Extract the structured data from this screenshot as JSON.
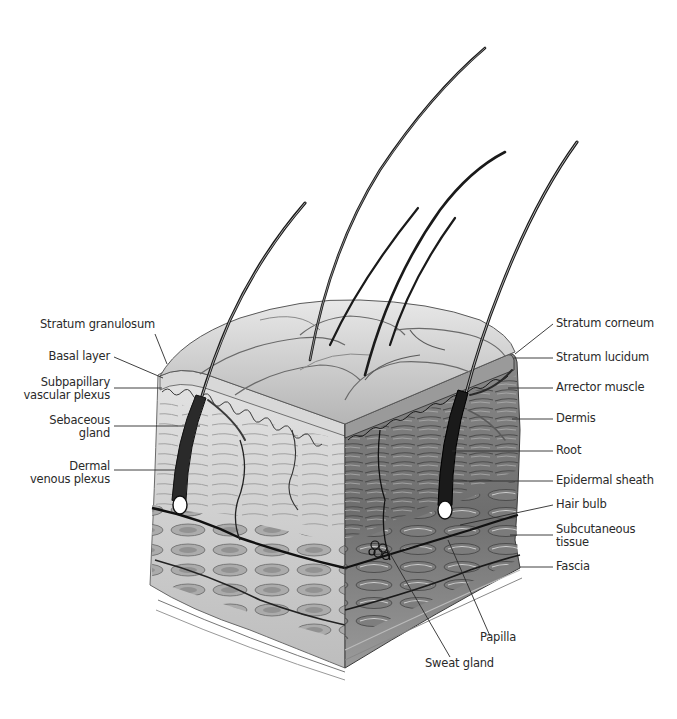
{
  "figure": {
    "colors": {
      "ink": "#1a1a1a",
      "mid": "#7a7a7a",
      "light": "#c8c8c8",
      "paper": "#ffffff",
      "label": "#2a2a2a"
    }
  },
  "labels_left": [
    {
      "id": "stratum-granulosum",
      "lines": [
        "Stratum granulosum"
      ]
    },
    {
      "id": "basal-layer",
      "lines": [
        "Basal layer"
      ]
    },
    {
      "id": "subpapillary-vascular-plexus",
      "lines": [
        "Subpapillary",
        "vascular plexus"
      ]
    },
    {
      "id": "sebaceous-gland",
      "lines": [
        "Sebaceous",
        "gland"
      ]
    },
    {
      "id": "dermal-venous-plexus",
      "lines": [
        "Dermal",
        "venous plexus"
      ]
    }
  ],
  "labels_right": [
    {
      "id": "stratum-corneum",
      "lines": [
        "Stratum corneum"
      ]
    },
    {
      "id": "stratum-lucidum",
      "lines": [
        "Stratum lucidum"
      ]
    },
    {
      "id": "arrector-muscle",
      "lines": [
        "Arrector muscle"
      ]
    },
    {
      "id": "dermis",
      "lines": [
        "Dermis"
      ]
    },
    {
      "id": "root",
      "lines": [
        "Root"
      ]
    },
    {
      "id": "epidermal-sheath",
      "lines": [
        "Epidermal sheath"
      ]
    },
    {
      "id": "hair-bulb",
      "lines": [
        "Hair bulb"
      ]
    },
    {
      "id": "subcutaneous-tissue",
      "lines": [
        "Subcutaneous",
        "tissue"
      ]
    },
    {
      "id": "fascia",
      "lines": [
        "Fascia"
      ]
    }
  ],
  "labels_bottom": [
    {
      "id": "papilla",
      "lines": [
        "Papilla"
      ]
    },
    {
      "id": "sweat-gland",
      "lines": [
        "Sweat gland"
      ]
    }
  ]
}
